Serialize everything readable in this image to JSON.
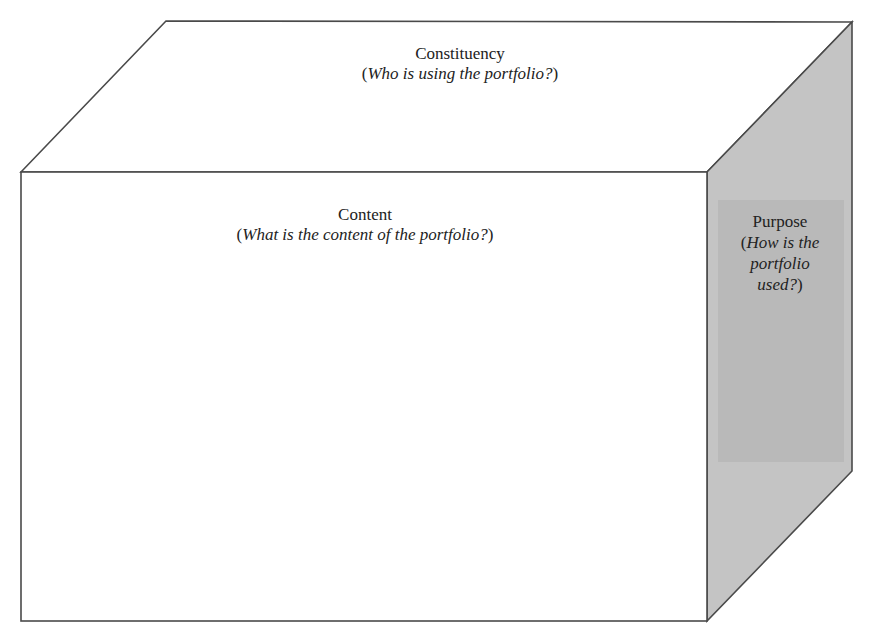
{
  "diagram": {
    "type": "3d-box",
    "colors": {
      "stroke": "#4a4a4a",
      "top_face": "#ffffff",
      "front_face": "#ffffff",
      "side_face": "#c4c4c4",
      "side_inner": "#b8b8b8",
      "text": "#222222"
    },
    "faces": {
      "top": {
        "title": "Constituency",
        "question": "Who is using the portfolio?"
      },
      "front": {
        "title": "Content",
        "question": "What is the content of the portfolio?"
      },
      "side": {
        "title": "Purpose",
        "question_lines": [
          "How is the",
          "portfolio",
          "used?"
        ]
      }
    }
  }
}
